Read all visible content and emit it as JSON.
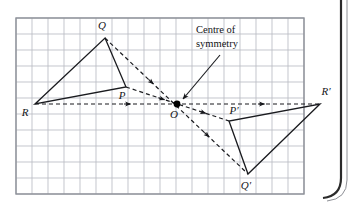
{
  "figure": {
    "kind": "point-symmetry-diagram",
    "background_color": "#ffffff",
    "page_edge_color": "#2a2a2a",
    "grid": {
      "color": "#b9bcc4",
      "cell_px": 16,
      "x0": 16,
      "y0": 18,
      "cols": 18,
      "rows": 11,
      "frame_color": "#8d9098"
    },
    "style": {
      "solid_stroke": "#1a1b1f",
      "dashed_stroke": "#1a1b1f",
      "dash_pattern": "4,3",
      "solid_width": 1.3,
      "dashed_width": 1.2,
      "point_fill": "#000000"
    },
    "annotation": {
      "line1": "Centre of",
      "line2": "symmetry",
      "x": 196,
      "y1": 33,
      "y2": 47,
      "leader": {
        "x1": 220,
        "y1": 55,
        "x2": 183,
        "y2": 99
      }
    },
    "points": [
      {
        "id": "Q",
        "label": "Q",
        "x": 105,
        "y": 38,
        "lx": 102,
        "ly": 29,
        "anchor": "middle"
      },
      {
        "id": "P",
        "label": "P",
        "x": 126,
        "y": 87,
        "lx": 122,
        "ly": 99,
        "anchor": "middle"
      },
      {
        "id": "R",
        "label": "R",
        "x": 35,
        "y": 104,
        "lx": 25,
        "ly": 116,
        "anchor": "middle"
      },
      {
        "id": "O",
        "label": "O",
        "x": 177,
        "y": 104,
        "lx": 174,
        "ly": 118,
        "anchor": "middle"
      },
      {
        "id": "Pp",
        "label": "P′",
        "x": 229,
        "y": 121,
        "lx": 234,
        "ly": 114,
        "anchor": "middle"
      },
      {
        "id": "Rp",
        "label": "R′",
        "x": 320,
        "y": 104,
        "lx": 326,
        "ly": 95,
        "anchor": "middle"
      },
      {
        "id": "Qp",
        "label": "Q′",
        "x": 248,
        "y": 174,
        "lx": 246,
        "ly": 189,
        "anchor": "middle"
      }
    ],
    "triangles": [
      {
        "name": "triangle-PQR",
        "vertices": "105,38 126,87 35,104"
      },
      {
        "name": "triangle-PQR-image",
        "vertices": "229,121 248,174 320,104"
      }
    ],
    "mapping_lines": [
      {
        "name": "mapping-line-Q-to-Qprime",
        "x1": 105,
        "y1": 38,
        "x2": 248,
        "y2": 174,
        "arrows": [
          0.33,
          0.72
        ]
      },
      {
        "name": "mapping-line-P-to-Pprime",
        "x1": 126,
        "y1": 87,
        "x2": 229,
        "y2": 121,
        "arrows": [
          0.36,
          0.76
        ]
      },
      {
        "name": "mapping-line-R-to-Rprime",
        "x1": 35,
        "y1": 104,
        "x2": 320,
        "y2": 104,
        "arrows": [
          0.33,
          0.8
        ]
      }
    ],
    "center_dot": {
      "x": 177,
      "y": 104,
      "r": 3.4
    }
  }
}
